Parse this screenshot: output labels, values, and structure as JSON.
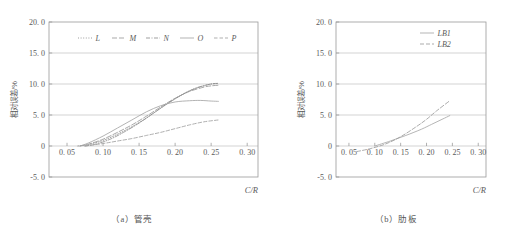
{
  "figure": {
    "panels": [
      {
        "id": "panel-a",
        "caption": "（a）管壳",
        "chart_data": {
          "type": "line",
          "title": "",
          "xlabel": "C/R",
          "ylabel": "相对误差/%",
          "xlim": [
            0.025,
            0.315
          ],
          "ylim": [
            -5.0,
            20.0
          ],
          "xticks": [
            0.05,
            0.1,
            0.15,
            0.2,
            0.25,
            0.3
          ],
          "xtick_labels": [
            "0. 05",
            "0. 10",
            "0. 15",
            "0. 20",
            "0. 25",
            "0. 30"
          ],
          "yticks": [
            -5.0,
            0,
            5.0,
            10.0,
            15.0,
            20.0
          ],
          "ytick_labels": [
            "-5. 0",
            "0",
            "5. 0",
            "10. 0",
            "15. 0",
            "20. 0"
          ],
          "grid": true,
          "grid_y_values": [
            0,
            5.0,
            10.0,
            15.0
          ],
          "legend_position": "top-center",
          "series": [
            {
              "name": "L",
              "dash": "1,1.6",
              "color": "#8c8c8c",
              "x": [
                0.065,
                0.08,
                0.1,
                0.12,
                0.14,
                0.16,
                0.18,
                0.2,
                0.22,
                0.24,
                0.25,
                0.26
              ],
              "y": [
                0.0,
                0.25,
                0.9,
                1.9,
                3.1,
                4.5,
                6.1,
                7.6,
                8.9,
                9.7,
                10.0,
                10.1
              ]
            },
            {
              "name": "M",
              "dash": "5,2",
              "color": "#9a9a9a",
              "x": [
                0.068,
                0.08,
                0.1,
                0.12,
                0.14,
                0.16,
                0.18,
                0.2,
                0.22,
                0.24,
                0.25,
                0.26
              ],
              "y": [
                0.0,
                0.3,
                1.1,
                2.2,
                3.4,
                4.8,
                6.3,
                7.7,
                8.8,
                9.5,
                9.7,
                9.8
              ]
            },
            {
              "name": "N",
              "dash": "4,1.5,1,1.5",
              "color": "#8f8f8f",
              "x": [
                0.075,
                0.09,
                0.11,
                0.13,
                0.15,
                0.17,
                0.19,
                0.21,
                0.23,
                0.25,
                0.26
              ],
              "y": [
                0.0,
                0.3,
                1.1,
                2.3,
                3.7,
                5.3,
                6.9,
                8.3,
                9.4,
                10.0,
                10.1
              ]
            },
            {
              "name": "O",
              "dash": "0",
              "color": "#a5a5a5",
              "x": [
                0.068,
                0.08,
                0.1,
                0.12,
                0.14,
                0.16,
                0.18,
                0.2,
                0.22,
                0.235,
                0.25,
                0.26
              ],
              "y": [
                0.0,
                0.5,
                1.6,
                2.9,
                4.2,
                5.5,
                6.5,
                7.1,
                7.3,
                7.35,
                7.25,
                7.2
              ]
            },
            {
              "name": "P",
              "dash": "3.5,2,3.5,2",
              "color": "#a0a0a0",
              "x": [
                0.075,
                0.1,
                0.12,
                0.14,
                0.16,
                0.18,
                0.2,
                0.22,
                0.24,
                0.26
              ],
              "y": [
                0.0,
                0.4,
                0.8,
                1.2,
                1.7,
                2.2,
                2.8,
                3.4,
                3.9,
                4.2
              ]
            }
          ]
        }
      },
      {
        "id": "panel-b",
        "caption": "（b）肋板",
        "chart_data": {
          "type": "line",
          "title": "",
          "xlabel": "C/R",
          "ylabel": "相对误差/%",
          "xlim": [
            0.025,
            0.315
          ],
          "ylim": [
            -5.0,
            20.0
          ],
          "xticks": [
            0.05,
            0.1,
            0.15,
            0.2,
            0.25,
            0.3
          ],
          "xtick_labels": [
            "0. 05",
            "0. 10",
            "0. 15",
            "0. 20",
            "0. 25",
            "0. 30"
          ],
          "yticks": [
            -5.0,
            0,
            5.0,
            10.0,
            15.0,
            20.0
          ],
          "ytick_labels": [
            "-5. 0",
            "0",
            "5. 0",
            "10. 0",
            "15. 0",
            "20. 0"
          ],
          "grid": true,
          "grid_y_values": [
            0,
            5.0,
            10.0,
            15.0
          ],
          "legend_position": "top-right",
          "series": [
            {
              "name": "LB1",
              "dash": "0",
              "color": "#a8a8a8",
              "x": [
                0.1,
                0.13,
                0.16,
                0.19,
                0.21,
                0.23,
                0.245
              ],
              "y": [
                0.0,
                0.8,
                1.7,
                2.7,
                3.5,
                4.3,
                4.9
              ]
            },
            {
              "name": "LB2",
              "dash": "4,2",
              "color": "#9c9c9c",
              "x": [
                0.065,
                0.09,
                0.12,
                0.15,
                0.18,
                0.2,
                0.22,
                0.245
              ],
              "y": [
                -0.9,
                -0.45,
                0.3,
                1.5,
                3.1,
                4.3,
                5.7,
                7.3
              ]
            }
          ]
        }
      }
    ]
  }
}
